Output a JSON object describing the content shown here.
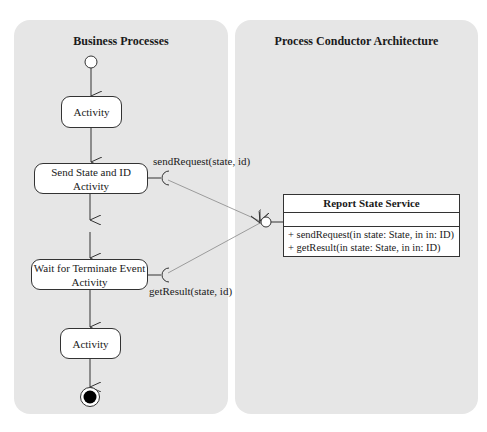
{
  "lanes": {
    "left": {
      "title": "Business Processes"
    },
    "right": {
      "title": "Process Conductor Architecture"
    }
  },
  "activities": [
    {
      "label": "Activity"
    },
    {
      "label": "Send State and ID Activity"
    },
    {
      "label": "Wait for Terminate Event Activity"
    },
    {
      "label": "Activity"
    }
  ],
  "activity_lines": {
    "send_1": "Send State and ID",
    "send_2": "Activity",
    "wait_1": "Wait for Terminate Event",
    "wait_2": "Activity"
  },
  "required_interfaces": [
    {
      "label": "sendRequest(state, id)"
    },
    {
      "label": "getResult(state, id)"
    }
  ],
  "service_class": {
    "name": "Report State Service",
    "operations": [
      "+ sendRequest(in state: State, in in: ID)",
      "+ getResult(in state: State, in in: ID)"
    ]
  },
  "colors": {
    "lane_bg": "#e6e6e6",
    "line": "#333333",
    "dependency_line": "#888888"
  }
}
